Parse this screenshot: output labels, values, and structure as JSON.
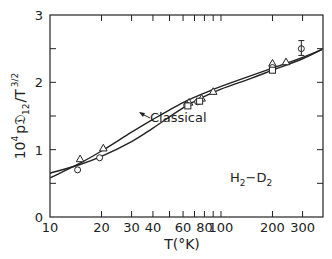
{
  "chart_data": {
    "type": "line",
    "title": "",
    "xlabel": "T(°K)",
    "ylabel": "10^4 p𝔇12/T^3/2",
    "ylabel_parts": {
      "prefix": "10",
      "exp": "4",
      "body": "p𝔇",
      "sub": "12",
      "slash": "/T",
      "texp": "3/2"
    },
    "xscale": "log",
    "xlim": [
      10,
      390
    ],
    "ylim": [
      0,
      3
    ],
    "grid": false,
    "x_ticks": [
      10,
      20,
      30,
      40,
      50,
      60,
      70,
      80,
      90,
      100,
      200,
      300
    ],
    "x_tick_labels": [
      {
        "value": 10,
        "label": "10"
      },
      {
        "value": 20,
        "label": "20"
      },
      {
        "value": 30,
        "label": "30"
      },
      {
        "value": 40,
        "label": "40"
      },
      {
        "value": 60,
        "label": "60"
      },
      {
        "value": 80,
        "label": "80"
      },
      {
        "value": 100,
        "label": "100"
      },
      {
        "value": 200,
        "label": "200"
      },
      {
        "value": 300,
        "label": "300"
      }
    ],
    "y_ticks": [
      0,
      0.5,
      1,
      1.5,
      2,
      2.5,
      3
    ],
    "y_tick_labels": [
      {
        "value": 0,
        "label": "0"
      },
      {
        "value": 1,
        "label": "1"
      },
      {
        "value": 2,
        "label": "2"
      },
      {
        "value": 3,
        "label": "3"
      }
    ],
    "series": [
      {
        "name": "Quantum (upper curve)",
        "style": "line",
        "x": [
          10,
          15,
          20,
          30,
          40,
          60,
          80,
          100,
          150,
          200,
          300,
          390
        ],
        "y": [
          0.58,
          0.8,
          0.98,
          1.26,
          1.45,
          1.7,
          1.84,
          1.94,
          2.1,
          2.21,
          2.37,
          2.49
        ]
      },
      {
        "name": "Classical",
        "style": "line",
        "x": [
          10,
          15,
          20,
          30,
          40,
          60,
          80,
          100,
          150,
          200,
          300,
          390
        ],
        "y": [
          0.65,
          0.78,
          0.9,
          1.12,
          1.32,
          1.62,
          1.79,
          1.9,
          2.06,
          2.18,
          2.35,
          2.49
        ]
      },
      {
        "name": "Data (triangles)",
        "style": "marker",
        "marker": "triangle",
        "x": [
          15,
          20.5,
          65,
          77,
          90,
          200,
          240
        ],
        "y": [
          0.86,
          1.02,
          1.7,
          1.76,
          1.86,
          2.28,
          2.3
        ]
      },
      {
        "name": "Data (circles)",
        "style": "marker",
        "marker": "circle",
        "x": [
          14.5,
          19.5,
          63,
          73,
          200,
          295
        ],
        "y": [
          0.7,
          0.88,
          1.66,
          1.71,
          2.22,
          2.5
        ]
      },
      {
        "name": "Data (squares)",
        "style": "marker",
        "marker": "square",
        "x": [
          64,
          75,
          200
        ],
        "y": [
          1.65,
          1.72,
          2.18
        ]
      }
    ],
    "annotations": [
      {
        "text": "Classical",
        "x": 48,
        "y": 1.42,
        "arrow_to": {
          "x": 40,
          "y": 1.34
        }
      },
      {
        "text": "H₂−D₂",
        "x": 190,
        "y": 0.6
      }
    ],
    "error_bars": [
      {
        "x": 295,
        "y": 2.5,
        "low": 2.4,
        "high": 2.62
      }
    ]
  },
  "labels": {
    "classical": "Classical",
    "system_main": "H",
    "system_sub1": "2",
    "system_dash": "−D",
    "system_sub2": "2",
    "xlabel": "T(°K)",
    "y_prefix": "10",
    "y_exp": "4",
    "y_body": "p𝔇",
    "y_sub": "12",
    "y_slash": "/T",
    "y_texp": "3/2"
  }
}
